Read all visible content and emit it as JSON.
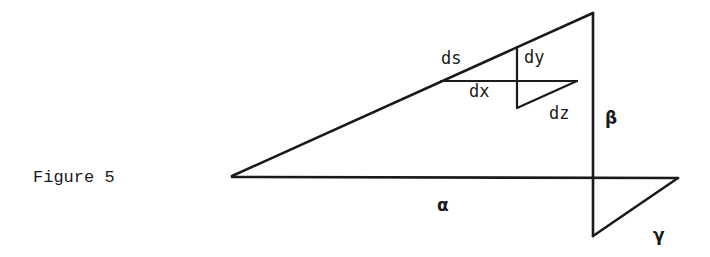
{
  "figure": {
    "caption": "Figure 5",
    "labels": {
      "ds": "ds",
      "dy": "dy",
      "dx": "dx",
      "dz": "dz",
      "alpha": "α",
      "beta": "β",
      "gamma": "γ"
    },
    "ink_color": "#1a1a1a",
    "background_color": "#ffffff"
  }
}
